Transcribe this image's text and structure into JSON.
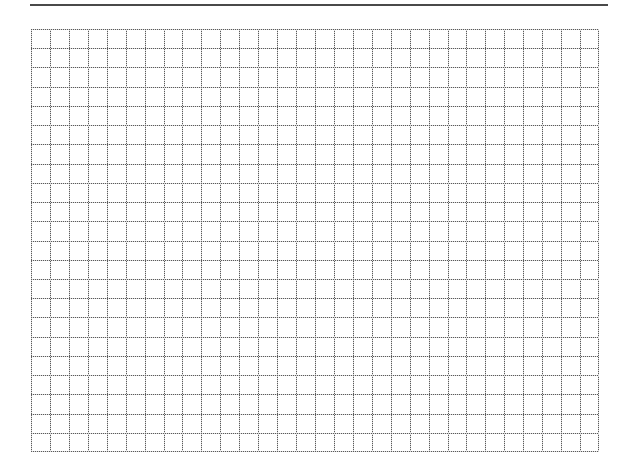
{
  "page": {
    "type": "blank graph paper grid",
    "background_color": "#ffffff"
  },
  "top_rule": {
    "color": "#4a4a4a",
    "thickness_px": 2
  },
  "grid": {
    "columns": 30,
    "rows": 22,
    "line_style": "dotted",
    "line_color": "#5a5a5a"
  }
}
